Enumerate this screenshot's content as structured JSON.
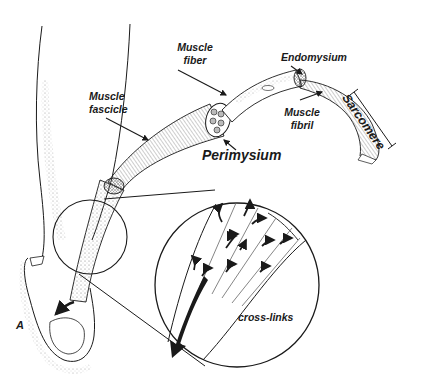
{
  "figure": {
    "header_text_cutoff": "",
    "panel_label": "A",
    "labels": {
      "muscle_fiber": [
        "Muscle",
        "fiber"
      ],
      "endomysium": "Endomysium",
      "muscle_fibril": [
        "Muscle",
        "fibril"
      ],
      "sarcomere": "Sarcomere",
      "muscle_fascicle": [
        "Muscle",
        "fascicle"
      ],
      "perimysium": "Perimysium",
      "cross_links": "cross-links"
    }
  },
  "colors": {
    "ink": "#1a1a1a",
    "background": "#ffffff",
    "stipple": "#8a8a8a"
  }
}
